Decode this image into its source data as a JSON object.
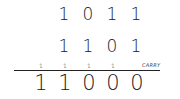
{
  "addition": {
    "operand1": [
      "1",
      "0",
      "1",
      "1"
    ],
    "operand2": [
      "1",
      "1",
      "0",
      "1"
    ],
    "carries": [
      "1",
      "1",
      "1",
      "1"
    ],
    "result": [
      "1",
      "1",
      "0",
      "0",
      "0"
    ],
    "carry_label": "CARRY"
  }
}
